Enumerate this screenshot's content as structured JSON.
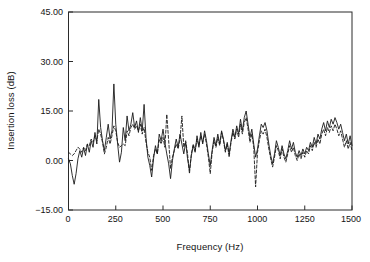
{
  "figure": {
    "background_color": "#ffffff",
    "axis_color": "#2b2b2b",
    "series_color": "#1a1a1a"
  },
  "chart_data": {
    "type": "line",
    "title": "",
    "xlabel": "Frequency (Hz)",
    "ylabel": "Insertion loss (dB)",
    "xlim": [
      0,
      1500
    ],
    "ylim": [
      -15,
      45
    ],
    "xticks": [
      0,
      250,
      500,
      750,
      1000,
      1250,
      1500
    ],
    "xtick_labels": [
      "0",
      "250",
      "500",
      "750",
      "1000",
      "1250",
      "1500"
    ],
    "yticks": [
      -15,
      0,
      15,
      30,
      45
    ],
    "ytick_labels": [
      "−15.00",
      "0.00",
      "15.00",
      "30.00",
      "45.00"
    ],
    "grid": false,
    "legend": "none",
    "frame": "box",
    "series": [
      {
        "name": "measured",
        "style": "solid",
        "x": [
          0,
          10,
          20,
          30,
          40,
          50,
          60,
          70,
          80,
          90,
          100,
          110,
          120,
          130,
          140,
          150,
          160,
          170,
          180,
          190,
          200,
          210,
          220,
          230,
          240,
          250,
          260,
          270,
          280,
          290,
          300,
          310,
          320,
          330,
          340,
          350,
          360,
          370,
          380,
          390,
          400,
          410,
          420,
          430,
          440,
          450,
          460,
          470,
          480,
          490,
          500,
          510,
          520,
          530,
          540,
          550,
          560,
          570,
          580,
          590,
          600,
          610,
          620,
          630,
          640,
          650,
          660,
          670,
          680,
          690,
          700,
          710,
          720,
          730,
          740,
          750,
          760,
          770,
          780,
          790,
          800,
          810,
          820,
          830,
          840,
          850,
          860,
          870,
          880,
          890,
          900,
          910,
          920,
          930,
          940,
          950,
          960,
          970,
          980,
          990,
          1000,
          1010,
          1020,
          1030,
          1040,
          1050,
          1060,
          1070,
          1080,
          1090,
          1100,
          1110,
          1120,
          1130,
          1140,
          1150,
          1160,
          1170,
          1180,
          1190,
          1200,
          1210,
          1220,
          1230,
          1240,
          1250,
          1260,
          1270,
          1280,
          1290,
          1300,
          1310,
          1320,
          1330,
          1340,
          1350,
          1360,
          1370,
          1380,
          1390,
          1400,
          1410,
          1420,
          1430,
          1440,
          1450,
          1460,
          1470,
          1480,
          1490,
          1500
        ],
        "y": [
          0.5,
          -1.0,
          -4.5,
          -7.2,
          -4.0,
          0.5,
          3.0,
          1.0,
          3.8,
          1.5,
          5.0,
          2.5,
          6.0,
          4.0,
          8.5,
          5.0,
          18.5,
          10.0,
          6.0,
          3.0,
          7.0,
          11.0,
          6.5,
          9.0,
          23.2,
          11.0,
          5.0,
          -0.5,
          2.5,
          10.0,
          6.0,
          13.5,
          9.0,
          11.0,
          14.5,
          10.0,
          12.0,
          8.5,
          13.0,
          9.0,
          17.0,
          7.0,
          1.0,
          -1.5,
          -5.0,
          0.5,
          4.5,
          2.0,
          8.0,
          6.0,
          9.5,
          5.5,
          2.0,
          -1.0,
          -5.5,
          0.0,
          3.5,
          6.5,
          4.0,
          8.0,
          5.0,
          2.0,
          5.5,
          0.5,
          -3.0,
          1.5,
          4.5,
          2.5,
          7.5,
          4.0,
          8.5,
          5.0,
          9.0,
          6.0,
          2.0,
          -1.5,
          3.0,
          7.0,
          4.5,
          8.0,
          5.0,
          9.0,
          6.5,
          3.0,
          5.5,
          2.0,
          6.0,
          9.5,
          7.0,
          10.5,
          8.0,
          12.5,
          9.0,
          13.0,
          15.0,
          11.0,
          7.0,
          9.5,
          5.0,
          1.0,
          3.5,
          7.5,
          11.0,
          10.0,
          11.5,
          9.0,
          5.0,
          1.5,
          -1.0,
          2.0,
          6.0,
          4.0,
          1.5,
          4.5,
          2.0,
          0.5,
          3.0,
          6.0,
          3.5,
          5.5,
          2.5,
          1.0,
          3.0,
          1.5,
          3.5,
          2.0,
          4.0,
          3.0,
          5.5,
          4.0,
          7.0,
          5.0,
          8.0,
          6.5,
          9.5,
          11.5,
          9.0,
          12.0,
          10.0,
          12.5,
          11.0,
          13.0,
          11.5,
          9.5,
          11.0,
          8.5,
          6.0,
          8.0,
          5.0,
          7.5,
          4.5
        ]
      },
      {
        "name": "predicted",
        "style": "dashed",
        "x": [
          0,
          10,
          20,
          30,
          40,
          50,
          60,
          70,
          80,
          90,
          100,
          110,
          120,
          130,
          140,
          150,
          160,
          170,
          180,
          190,
          200,
          210,
          220,
          230,
          240,
          250,
          260,
          270,
          280,
          290,
          300,
          310,
          320,
          330,
          340,
          350,
          360,
          370,
          380,
          390,
          400,
          410,
          420,
          430,
          440,
          450,
          460,
          470,
          480,
          490,
          500,
          510,
          520,
          530,
          540,
          550,
          560,
          570,
          580,
          590,
          600,
          610,
          620,
          630,
          640,
          650,
          660,
          670,
          680,
          690,
          700,
          710,
          720,
          730,
          740,
          750,
          760,
          770,
          780,
          790,
          800,
          810,
          820,
          830,
          840,
          850,
          860,
          870,
          880,
          890,
          900,
          910,
          920,
          930,
          940,
          950,
          960,
          970,
          980,
          990,
          1000,
          1010,
          1020,
          1030,
          1040,
          1050,
          1060,
          1070,
          1080,
          1090,
          1100,
          1110,
          1120,
          1130,
          1140,
          1150,
          1160,
          1170,
          1180,
          1190,
          1200,
          1210,
          1220,
          1230,
          1240,
          1250,
          1260,
          1270,
          1280,
          1290,
          1300,
          1310,
          1320,
          1330,
          1340,
          1350,
          1360,
          1370,
          1380,
          1390,
          1400,
          1410,
          1420,
          1430,
          1440,
          1450,
          1460,
          1470,
          1480,
          1490,
          1500
        ],
        "y": [
          2.5,
          2.0,
          1.5,
          2.0,
          3.0,
          4.0,
          3.5,
          2.5,
          4.0,
          3.0,
          5.0,
          4.5,
          6.5,
          5.5,
          7.5,
          6.0,
          9.5,
          8.0,
          5.5,
          2.0,
          4.0,
          7.0,
          5.0,
          7.5,
          10.5,
          9.0,
          5.5,
          4.0,
          4.5,
          5.0,
          4.5,
          9.0,
          7.5,
          10.0,
          11.0,
          9.5,
          10.5,
          9.0,
          11.0,
          8.0,
          10.0,
          5.5,
          2.5,
          1.0,
          -3.0,
          1.5,
          3.5,
          2.0,
          6.5,
          5.0,
          7.0,
          4.0,
          14.0,
          6.0,
          -2.5,
          1.0,
          3.0,
          5.0,
          3.5,
          6.5,
          13.5,
          4.0,
          6.0,
          2.0,
          -4.0,
          2.0,
          5.0,
          3.0,
          6.5,
          4.5,
          7.5,
          5.5,
          8.0,
          5.0,
          1.0,
          -4.0,
          2.5,
          6.0,
          4.0,
          7.0,
          4.5,
          8.5,
          6.0,
          2.5,
          5.0,
          1.0,
          5.5,
          8.5,
          6.5,
          9.5,
          7.0,
          11.0,
          8.0,
          11.5,
          13.0,
          9.5,
          5.5,
          8.0,
          4.0,
          -8.0,
          2.5,
          6.0,
          9.0,
          8.0,
          9.5,
          7.0,
          3.5,
          0.5,
          -2.0,
          1.0,
          4.5,
          3.0,
          0.5,
          3.5,
          1.0,
          -0.5,
          2.0,
          4.5,
          2.5,
          4.0,
          1.5,
          0.0,
          2.0,
          0.5,
          2.5,
          1.0,
          3.0,
          2.0,
          4.5,
          3.0,
          5.5,
          4.0,
          6.5,
          5.0,
          8.0,
          9.5,
          7.5,
          10.0,
          8.5,
          10.5,
          9.0,
          11.0,
          9.5,
          7.5,
          9.0,
          6.5,
          4.0,
          6.0,
          3.5,
          5.5,
          3.0
        ]
      }
    ]
  }
}
